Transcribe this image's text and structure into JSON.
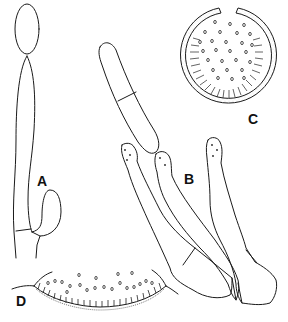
{
  "figure": {
    "width": 288,
    "height": 322,
    "background": "#ffffff",
    "line_color": "#1a1a1a",
    "panels": [
      {
        "id": "A",
        "label": "A",
        "description": "elongated cell with apical globose vesicle and lateral ellipsoid swelling near base",
        "label_pos": [
          37,
          174
        ]
      },
      {
        "id": "B",
        "label": "B",
        "description": "three elongated branched cells with warty apices, one bearing a septate cylindrical conidium",
        "label_pos": [
          184,
          172
        ]
      },
      {
        "id": "C",
        "label": "C",
        "description": "globose ascoma/fruit body in section with apical ostiole, striate basal layer and scattered spores",
        "label_pos": [
          248,
          112
        ]
      },
      {
        "id": "D",
        "label": "D",
        "description": "partial section of fruiting body showing palisade layer and spores",
        "label_pos": [
          16,
          294
        ]
      }
    ]
  }
}
